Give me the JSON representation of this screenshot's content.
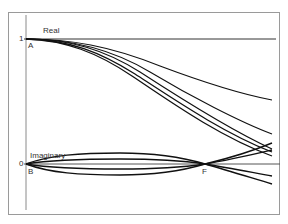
{
  "diagram": {
    "labels": {
      "real": "Real",
      "imaginary": "Imaginary",
      "tick_one": "1",
      "tick_zero": "0",
      "point_a": "A",
      "point_b": "B",
      "point_f": "F"
    },
    "colors": {
      "curve": "#111111",
      "axis": "#8a8a8a",
      "frame": "#9a9a9a",
      "reference_line": "#333333"
    },
    "real_curves_end_y": [
      100,
      134,
      149,
      152,
      156
    ],
    "imaginary_curves_after_f_end_y": [
      143,
      150,
      176,
      184
    ]
  }
}
